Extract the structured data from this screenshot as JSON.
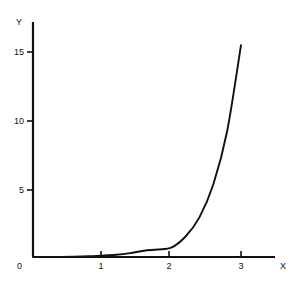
{
  "chart_data": {
    "type": "line",
    "title": "",
    "subtitle": "",
    "xlabel": "X",
    "ylabel": "Y",
    "xlim": [
      0,
      3.5
    ],
    "ylim": [
      0,
      17
    ],
    "grid": false,
    "legend": null,
    "legend_position": "none",
    "origin_label": "0",
    "xticks": [
      1,
      2,
      3
    ],
    "xtick_labels": [
      "1",
      "2",
      "3"
    ],
    "yticks": [
      5,
      10,
      15
    ],
    "ytick_labels": [
      "5",
      "10",
      "15"
    ],
    "line_color": "#111111",
    "axis_color": "#111111",
    "background_color": "#ffffff",
    "series": [
      {
        "name": "curve",
        "x": [
          0.0,
          0.2,
          0.4,
          0.6,
          0.8,
          1.0,
          1.2,
          1.4,
          1.6,
          1.8,
          2.0,
          2.2,
          2.4,
          2.6,
          2.8,
          3.0
        ],
        "y": [
          0.0,
          0.0,
          0.01,
          0.03,
          0.06,
          0.1,
          0.16,
          0.28,
          0.46,
          0.55,
          0.7,
          1.5,
          2.9,
          5.3,
          9.2,
          15.5
        ]
      }
    ],
    "annotations": []
  },
  "axes": {
    "y_axis_name": "Y",
    "x_axis_name": "X"
  }
}
